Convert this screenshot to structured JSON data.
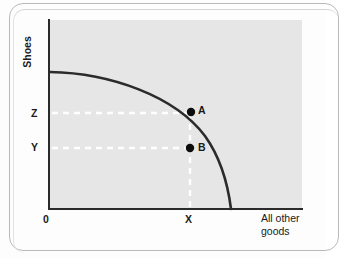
{
  "figure": {
    "type": "production-possibilities-frontier",
    "background_color": "#e6e6e6",
    "axis_color": "#2b2b2b",
    "curve_color": "#2b2b2b",
    "guide_color": "#ffffff",
    "point_color": "#0d0d0d",
    "axes": {
      "y_label": "Shoes",
      "x_label_line1": "All other",
      "x_label_line2": "goods",
      "origin_label": "0"
    },
    "tick_labels": {
      "y_upper": "Z",
      "y_lower": "Y",
      "x": "X"
    },
    "points": [
      {
        "name": "A",
        "label": "A",
        "on_curve": true,
        "x_tick": "X",
        "y_tick": "Z"
      },
      {
        "name": "B",
        "label": "B",
        "on_curve": false,
        "x_tick": "X",
        "y_tick": "Y"
      }
    ],
    "guides": [
      {
        "from": "Z",
        "to": "A",
        "style": "dashed",
        "orientation": "horizontal"
      },
      {
        "from": "Y",
        "to": "B",
        "style": "dashed",
        "orientation": "horizontal"
      },
      {
        "from": "X",
        "to": "A",
        "style": "dashed",
        "orientation": "vertical"
      }
    ]
  }
}
